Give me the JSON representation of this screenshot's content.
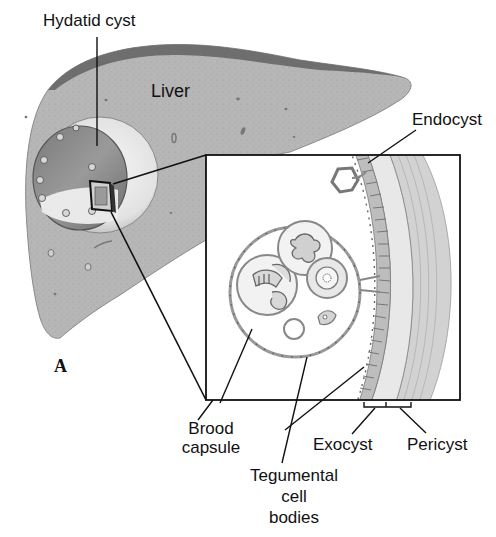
{
  "figure": {
    "panel_letter": "A"
  },
  "labels": {
    "hydatid_cyst": "Hydatid cyst",
    "liver": "Liver",
    "endocyst": "Endocyst",
    "brood_capsule_line1": "Brood",
    "brood_capsule_line2": "capsule",
    "tegumental_line1": "Tegumental",
    "tegumental_line2": "cell",
    "tegumental_line3": "bodies",
    "exocyst": "Exocyst",
    "pericyst": "Pericyst"
  },
  "colors": {
    "liver_fill": "#b4b4b4",
    "liver_capsule": "#6e6e6e",
    "cyst_fill": "#e6e6e6",
    "cyst_interior": "#8c8c8c",
    "line": "#111111",
    "wall_striation": "#8a8a8a",
    "pericyst_fill": "#d2d2d2"
  }
}
